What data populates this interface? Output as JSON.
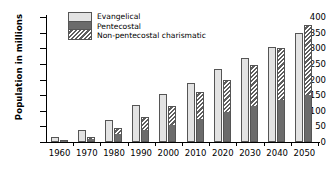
{
  "chart_data": {
    "type": "bar",
    "title": "",
    "xlabel": "",
    "ylabel": "Population in millions",
    "ylim": [
      0,
      400
    ],
    "yticks": [
      0,
      50,
      100,
      150,
      200,
      250,
      300,
      350,
      400
    ],
    "grid": false,
    "legend_position": "top-left",
    "categories": [
      "1960",
      "1970",
      "1980",
      "1990",
      "2000",
      "2010",
      "2020",
      "2030",
      "2040",
      "2050"
    ],
    "series": [
      {
        "name": "Evangelical",
        "style": "light-gray-solid",
        "color": "#e3e3e3",
        "values": [
          15,
          40,
          70,
          120,
          155,
          190,
          235,
          270,
          305,
          350
        ]
      },
      {
        "name": "Pentecostal",
        "style": "dark-gray-solid",
        "color": "#6b6b6b",
        "stack": "charismatic",
        "stack_position": "bottom",
        "values": [
          5,
          10,
          25,
          40,
          55,
          75,
          95,
          115,
          135,
          150
        ]
      },
      {
        "name": "Non-pentecostal charismatic",
        "style": "diagonal-hatch",
        "color": "#5e5e5e",
        "stack": "charismatic",
        "stack_position": "top",
        "values": [
          3,
          5,
          20,
          40,
          60,
          85,
          105,
          130,
          165,
          225
        ],
        "stack_totals": [
          8,
          15,
          45,
          80,
          115,
          160,
          200,
          245,
          300,
          375
        ]
      }
    ]
  },
  "legend": {
    "items": [
      {
        "label": "Evangelical"
      },
      {
        "label": "Pentecostal"
      },
      {
        "label": "Non-pentecostal charismatic"
      }
    ]
  }
}
